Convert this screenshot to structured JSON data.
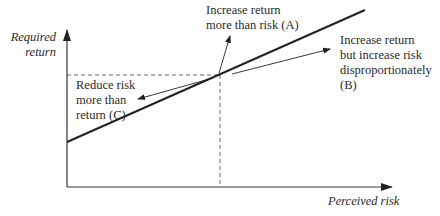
{
  "diagram": {
    "type": "risk-return line",
    "axes": {
      "y_label_line1": "Required",
      "y_label_line2": "return",
      "x_label": "Perceived risk"
    },
    "annotations": {
      "a_line1": "Increase return",
      "a_line2": "more than risk (A)",
      "b_line1": "Increase return",
      "b_line2": "but increase risk",
      "b_line3": "disproportionately",
      "b_line4": "(B)",
      "c_line1": "Reduce risk",
      "c_line2": "more than",
      "c_line3": "return (C)"
    },
    "colors": {
      "line": "#222222",
      "dashed": "#555555"
    }
  }
}
